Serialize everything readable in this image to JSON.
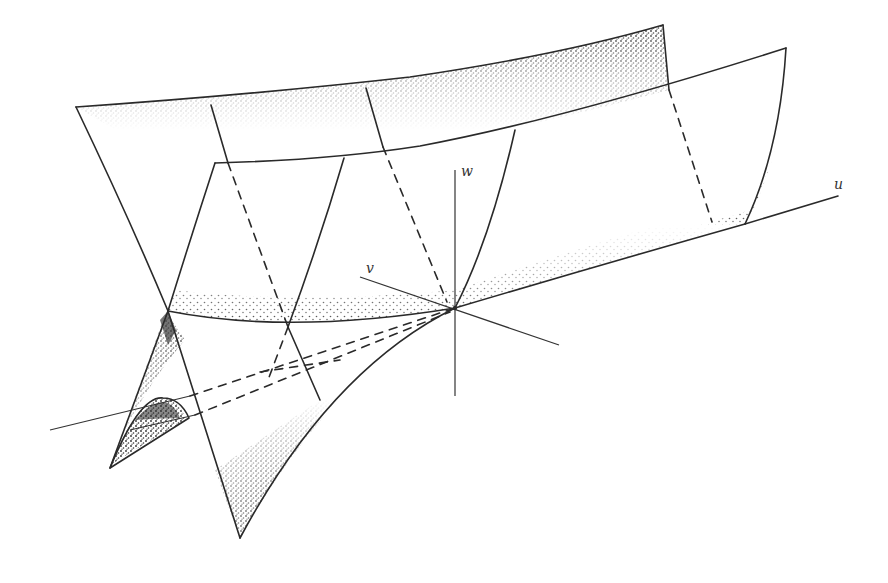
{
  "figure": {
    "type": "3d-surface-diagram",
    "axes": {
      "u": {
        "label": "u"
      },
      "v": {
        "label": "v"
      },
      "w": {
        "label": "w"
      }
    },
    "colors": {
      "ink": "#2a2a2a",
      "stipple": "#3a3a3a",
      "background": "#ffffff"
    }
  }
}
